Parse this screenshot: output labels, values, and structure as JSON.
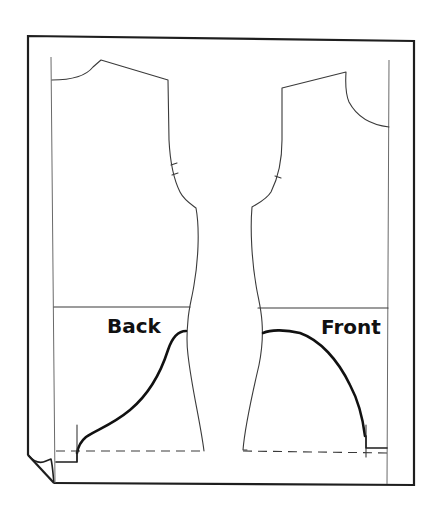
{
  "figure": {
    "type": "sewing-pattern-diagram"
  },
  "labels": {
    "back": "Back",
    "front": "Front"
  },
  "colors": {
    "background": "#ffffff",
    "line": "#3a3a3a",
    "border": "#1e1e1e",
    "curve": "#111111",
    "text": "#111111"
  },
  "pieces": [
    {
      "name": "back",
      "label_ref": "labels.back",
      "armhole_notches": 2
    },
    {
      "name": "front",
      "label_ref": "labels.front",
      "armhole_notches": 1
    }
  ]
}
